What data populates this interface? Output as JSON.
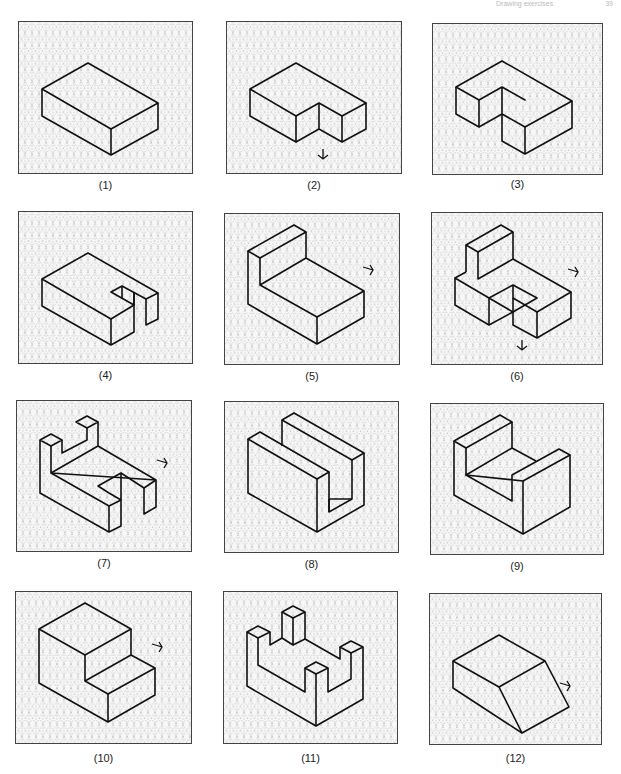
{
  "header": {
    "text": "Drawing exercises",
    "page": "39"
  },
  "style": {
    "grid_color": "#9a9a9a",
    "line_color": "#111111",
    "frame_color": "#444444",
    "background": "#f7f7f7"
  },
  "figures": [
    {
      "label": "(1)",
      "description": "Rectangular block"
    },
    {
      "label": "(2)",
      "description": "L-shaped block with notch, viewing arrow below"
    },
    {
      "label": "(3)",
      "description": "Block with rectangular cutout corner"
    },
    {
      "label": "(4)",
      "description": "Block with slot in right end"
    },
    {
      "label": "(5)",
      "description": "Block with raised back wall, viewing arrow right"
    },
    {
      "label": "(6)",
      "description": "Stepped block with upright, viewing arrows right and below"
    },
    {
      "label": "(7)",
      "description": "Block with stepped uprights and slot, viewing arrow right"
    },
    {
      "label": "(8)",
      "description": "U-channel block"
    },
    {
      "label": "(9)",
      "description": "Block with U-shaped recess"
    },
    {
      "label": "(10)",
      "description": "Stepped block, viewing arrow right"
    },
    {
      "label": "(11)",
      "description": "Base with four posts"
    },
    {
      "label": "(12)",
      "description": "Block with sloped face, viewing arrow right"
    }
  ]
}
